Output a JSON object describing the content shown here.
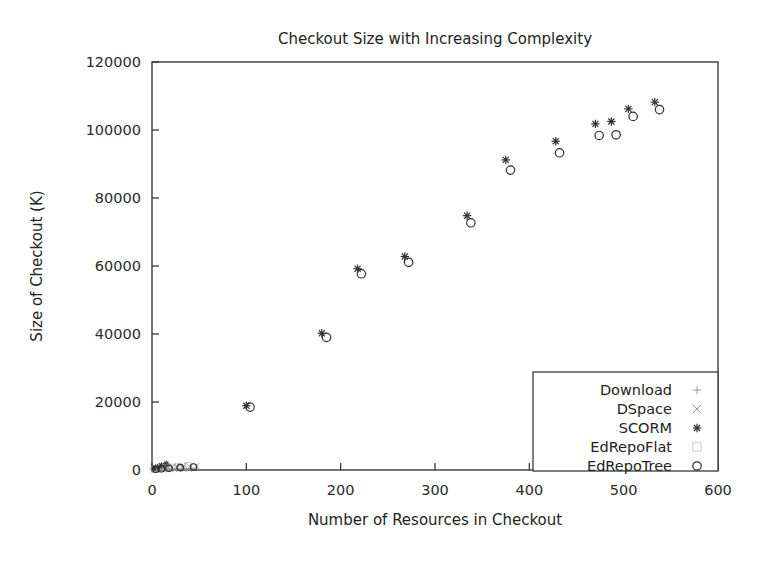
{
  "chart_data": {
    "type": "scatter",
    "title": "Checkout Size with Increasing Complexity",
    "xlabel": "Number of Resources in Checkout",
    "ylabel": "Size of Checkout (K)",
    "xlim": [
      0,
      600
    ],
    "ylim": [
      0,
      120000
    ],
    "xticks": [
      0,
      100,
      200,
      300,
      400,
      500,
      600
    ],
    "yticks": [
      0,
      20000,
      40000,
      60000,
      80000,
      100000,
      120000
    ],
    "xtick_labels": [
      "0",
      "100",
      "200",
      "300",
      "400",
      "500",
      "600"
    ],
    "ytick_labels": [
      "0",
      "20000",
      "40000",
      "60000",
      "80000",
      "100000",
      "120000"
    ],
    "grid": false,
    "legend_position": "lower right",
    "series": [
      {
        "name": "Download",
        "marker": "plus",
        "points": [
          [
            1,
            120
          ],
          [
            3,
            150
          ],
          [
            5,
            180
          ],
          [
            8,
            200
          ],
          [
            11,
            220
          ],
          [
            14,
            250
          ],
          [
            18,
            280
          ],
          [
            22,
            300
          ],
          [
            26,
            330
          ],
          [
            31,
            360
          ],
          [
            36,
            390
          ],
          [
            42,
            420
          ]
        ]
      },
      {
        "name": "DSpace",
        "marker": "cross",
        "points": [
          [
            2,
            300
          ],
          [
            5,
            420
          ],
          [
            9,
            520
          ],
          [
            13,
            610
          ],
          [
            17,
            700
          ],
          [
            21,
            790
          ],
          [
            27,
            880
          ],
          [
            33,
            960
          ],
          [
            40,
            1050
          ],
          [
            47,
            1140
          ]
        ]
      },
      {
        "name": "SCORM",
        "marker": "asterisk",
        "points": [
          [
            2,
            500
          ],
          [
            6,
            900
          ],
          [
            10,
            1300
          ],
          [
            15,
            1800
          ],
          [
            100,
            18900
          ],
          [
            180,
            40200
          ],
          [
            218,
            59200
          ],
          [
            268,
            62800
          ],
          [
            334,
            74800
          ],
          [
            375,
            91200
          ],
          [
            428,
            96700
          ],
          [
            470,
            101800
          ],
          [
            487,
            102500
          ],
          [
            505,
            106200
          ],
          [
            533,
            108200
          ]
        ]
      },
      {
        "name": "EdRepoFlat",
        "marker": "square-dotted",
        "points": [
          [
            3,
            250
          ],
          [
            8,
            400
          ],
          [
            14,
            600
          ],
          [
            20,
            800
          ],
          [
            28,
            1000
          ],
          [
            38,
            1250
          ]
        ]
      },
      {
        "name": "EdRepoTree",
        "marker": "circle",
        "points": [
          [
            4,
            200
          ],
          [
            10,
            350
          ],
          [
            18,
            520
          ],
          [
            30,
            700
          ],
          [
            44,
            900
          ],
          [
            104,
            18500
          ],
          [
            185,
            39000
          ],
          [
            222,
            57700
          ],
          [
            272,
            61100
          ],
          [
            338,
            72700
          ],
          [
            380,
            88200
          ],
          [
            432,
            93300
          ],
          [
            474,
            98400
          ],
          [
            492,
            98600
          ],
          [
            510,
            104000
          ],
          [
            538,
            106000
          ]
        ]
      }
    ],
    "legend_entries": [
      {
        "label": "Download",
        "marker": "plus"
      },
      {
        "label": "DSpace",
        "marker": "cross"
      },
      {
        "label": "SCORM",
        "marker": "asterisk"
      },
      {
        "label": "EdRepoFlat",
        "marker": "square-dotted"
      },
      {
        "label": "EdRepoTree",
        "marker": "circle"
      }
    ],
    "colors": {
      "background": "#ffffff",
      "axis": "#3a3a3a",
      "text": "#232323",
      "marker": "#2e2e2e",
      "marker_faint": "#9a9a9a"
    }
  }
}
